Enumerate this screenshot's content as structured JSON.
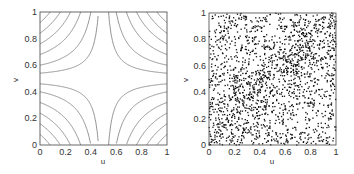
{
  "chart_data": [
    {
      "type": "contour",
      "title": "",
      "xlabel": "u",
      "ylabel": "v",
      "xlim": [
        0,
        1
      ],
      "ylim": [
        0,
        1
      ],
      "xticks": [
        "0",
        "0.2",
        "0.4",
        "0.6",
        "0.8",
        "1"
      ],
      "yticks": [
        "0",
        "0.2",
        "0.4",
        "0.6",
        "0.8",
        "1"
      ],
      "grid": false,
      "description": "Copula density contour plot with saddle shape; high density at corners (0,0) and (1,1), diagonal bands"
    },
    {
      "type": "scatter",
      "title": "",
      "xlabel": "u",
      "ylabel": "v",
      "xlim": [
        0,
        1
      ],
      "ylim": [
        0,
        1
      ],
      "xticks": [
        "0",
        "0.2",
        "0.4",
        "0.6",
        "0.8",
        "1"
      ],
      "yticks": [
        "0",
        "0.2",
        "0.4",
        "0.6",
        "0.8",
        "1"
      ],
      "grid": false,
      "n_points_approx": 2000,
      "description": "Random samples from copula on unit square, denser near corners (0,0) and (1,1)"
    }
  ],
  "left": {
    "xlabel": "u",
    "ylabel": "v",
    "xticks": [
      "0",
      "0.2",
      "0.4",
      "0.6",
      "0.8",
      "1"
    ],
    "yticks": [
      "0",
      "0.2",
      "0.4",
      "0.6",
      "0.8",
      "1"
    ]
  },
  "right": {
    "xlabel": "u",
    "ylabel": "v",
    "xticks": [
      "0",
      "0.2",
      "0.4",
      "0.6",
      "0.8",
      "1"
    ],
    "yticks": [
      "0",
      "0.2",
      "0.4",
      "0.6",
      "0.8",
      "1"
    ]
  }
}
